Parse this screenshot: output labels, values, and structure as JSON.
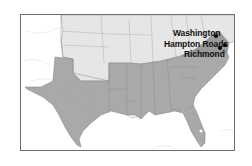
{
  "map": {
    "title": "",
    "colors": {
      "confederacy": "#a9a9a9",
      "union": "#e6e6e6",
      "territories": "#ffffff",
      "virginia_highlight": "#9a9a9a",
      "border": "#6e6e6e",
      "state_lines": "#8a8a8a",
      "water": "#ffffff"
    },
    "cities": [
      {
        "name": "Washington",
        "x": 215,
        "y": 35
      },
      {
        "name": "Hampton Roads",
        "x": 224,
        "y": 44
      },
      {
        "name": "Richmond",
        "x": 219,
        "y": 47
      }
    ]
  }
}
